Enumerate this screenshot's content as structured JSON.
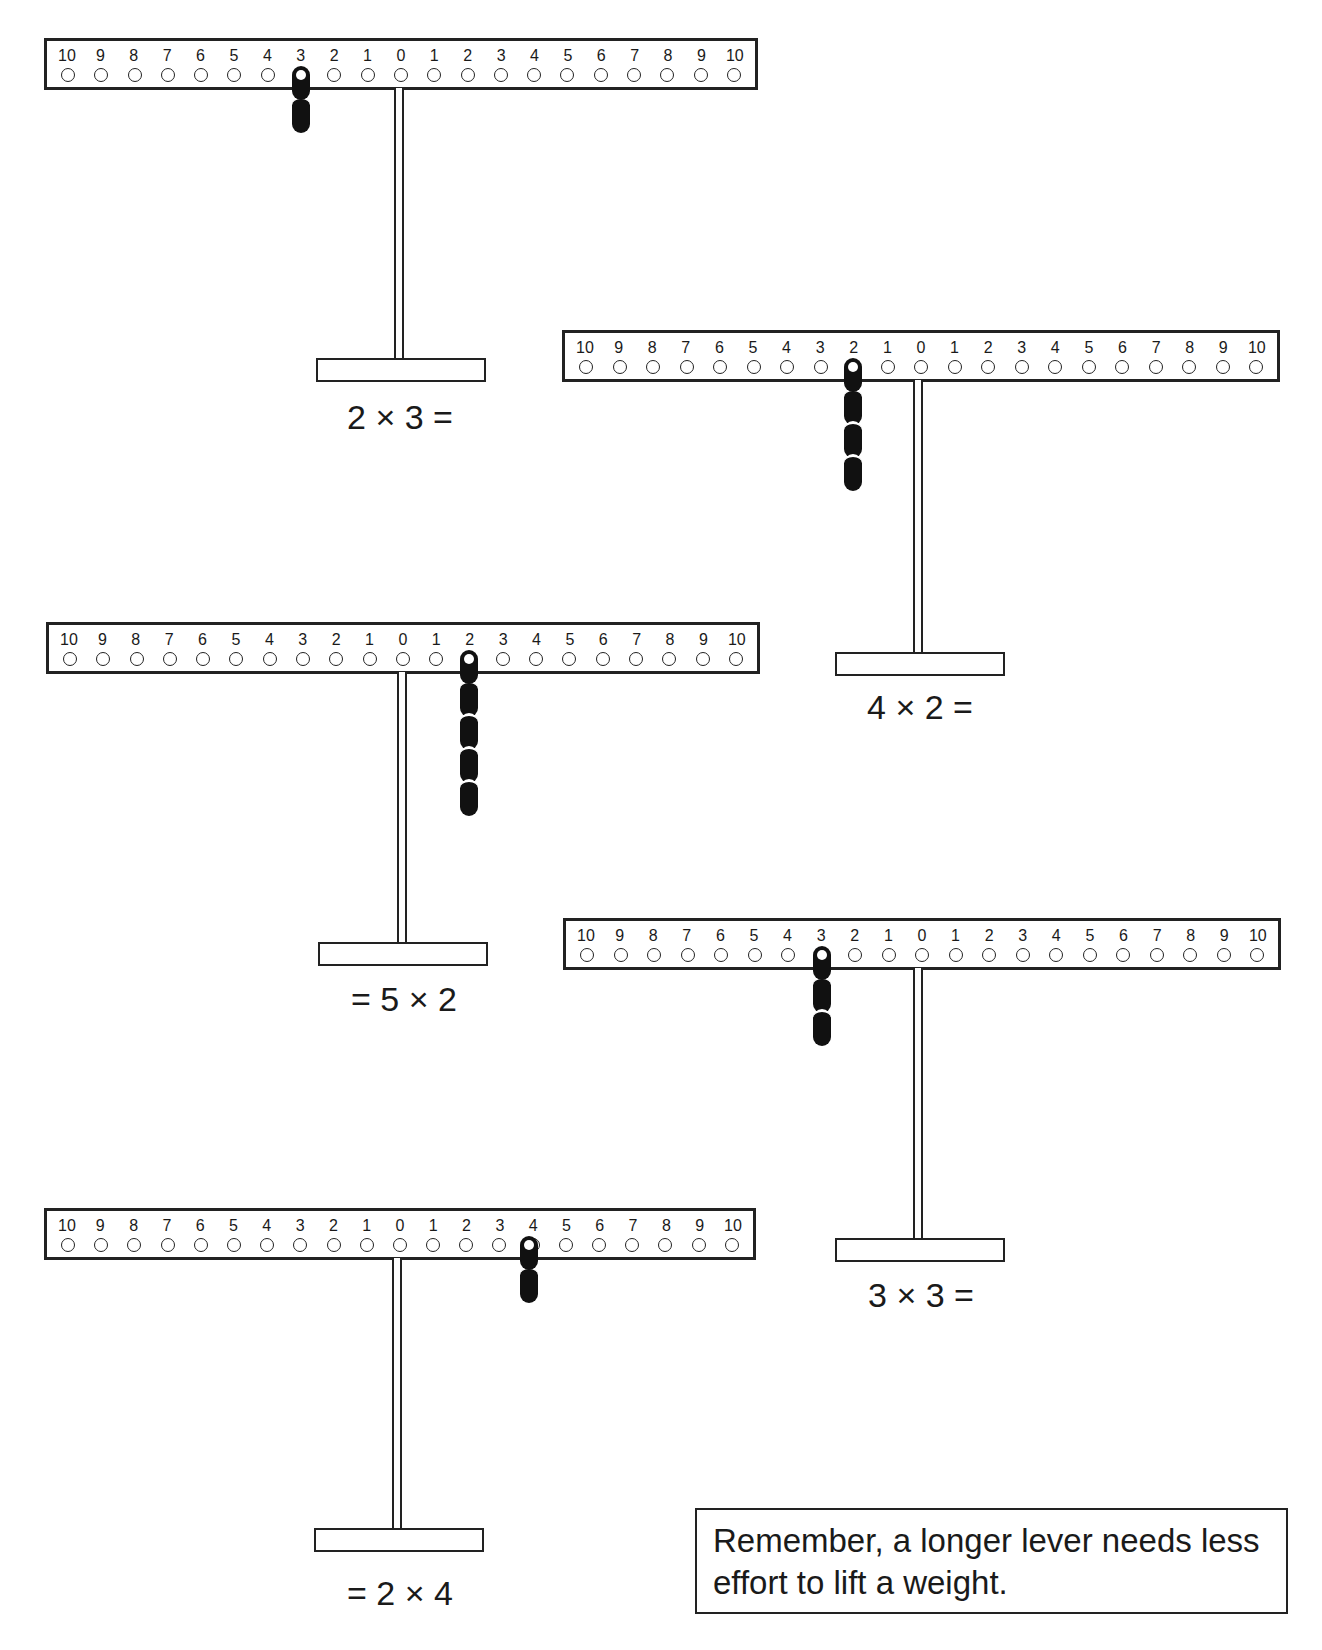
{
  "scale_labels": [
    "10",
    "9",
    "8",
    "7",
    "6",
    "5",
    "4",
    "3",
    "2",
    "1",
    "0",
    "1",
    "2",
    "3",
    "4",
    "5",
    "6",
    "7",
    "8",
    "9",
    "10"
  ],
  "levers": [
    {
      "id": "lever-1",
      "weight_position": "left 3",
      "weight_count": 2,
      "equation": "2 × 3 ="
    },
    {
      "id": "lever-2",
      "weight_position": "left 2",
      "weight_count": 4,
      "equation": "4 × 2 ="
    },
    {
      "id": "lever-3",
      "weight_position": "right 2",
      "weight_count": 5,
      "equation": "= 5 × 2"
    },
    {
      "id": "lever-4",
      "weight_position": "left 3",
      "weight_count": 3,
      "equation": "3 × 3 ="
    },
    {
      "id": "lever-5",
      "weight_position": "right 4",
      "weight_count": 2,
      "equation": "= 2 × 4"
    }
  ],
  "note": {
    "text": "Remember, a longer lever needs less effort to lift a weight."
  }
}
